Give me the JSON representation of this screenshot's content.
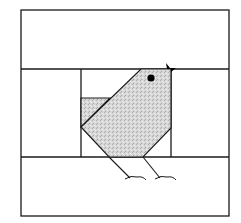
{
  "diagram": {
    "type": "quilt-block",
    "colors": {
      "background": "#ffffff",
      "line": "#1a1a1a",
      "fabric_fill": "#d4d4d4",
      "eye": "#000000",
      "beak": "#000000"
    },
    "regions": [
      {
        "name": "top-strip"
      },
      {
        "name": "left-panel"
      },
      {
        "name": "center-panel"
      },
      {
        "name": "right-panel"
      },
      {
        "name": "bottom-strip"
      },
      {
        "name": "bird-body"
      },
      {
        "name": "bird-tail"
      }
    ]
  }
}
